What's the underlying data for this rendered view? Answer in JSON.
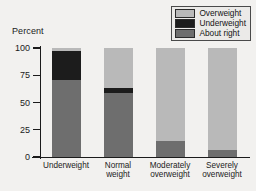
{
  "chart_data": {
    "type": "bar",
    "subtype": "stacked-100-percent",
    "title": "",
    "xlabel": "",
    "ylabel": "Percent",
    "ylim": [
      0,
      100
    ],
    "yticks": [
      0,
      25,
      50,
      75,
      100
    ],
    "grid": false,
    "legend_position": "top-right",
    "categories": [
      "Underweight",
      "Normal weight",
      "Moderately overweight",
      "Severely overweight"
    ],
    "series": [
      {
        "name": "About right",
        "color": "#6e6e6e",
        "values": [
          71,
          59,
          15,
          6
        ]
      },
      {
        "name": "Underweight",
        "color": "#1c1c1c",
        "values": [
          26,
          4,
          0,
          0
        ]
      },
      {
        "name": "Overweight",
        "color": "#b9b9b9",
        "values": [
          3,
          37,
          85,
          94
        ]
      }
    ]
  },
  "axis": {
    "y_title": "Percent",
    "tick_labels": [
      "100",
      "75",
      "50",
      "25",
      "0"
    ],
    "x_tick_labels": [
      "Underweight",
      "Normal\nweight",
      "Moderately\noverweight",
      "Severely\noverweight"
    ]
  },
  "legend": {
    "entries": [
      {
        "label": "Overweight",
        "color": "#b9b9b9"
      },
      {
        "label": "Underweight",
        "color": "#1c1c1c"
      },
      {
        "label": "About right",
        "color": "#6e6e6e"
      }
    ]
  },
  "colors": {
    "background": "#f2f1ef",
    "axis": "#1b1b1b",
    "overweight": "#b9b9b9",
    "underweight": "#1c1c1c",
    "about_right": "#6e6e6e"
  }
}
